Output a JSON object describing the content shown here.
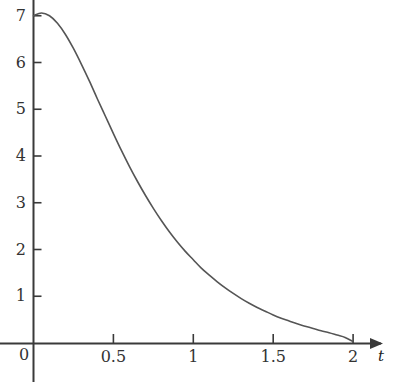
{
  "chart_data": {
    "type": "line",
    "title": "",
    "subtitle": "",
    "xlabel": "t",
    "ylabel": "",
    "xlim": [
      0,
      2.13
    ],
    "ylim": [
      -0.08,
      7.45
    ],
    "grid": false,
    "legend": null,
    "axis_style": {
      "x_axis_arrow": true,
      "y_axis_arrow": false,
      "x_tick_direction": "up",
      "y_tick_direction": "right",
      "axis_color": "#3a3a3a",
      "curve_color": "#555555",
      "curve_width": 1.6
    },
    "xticks": [
      0,
      0.5,
      1,
      1.5,
      2
    ],
    "xtick_labels": [
      "0",
      "0.5",
      "1",
      "1.5",
      "2"
    ],
    "yticks": [
      0,
      1,
      2,
      3,
      4,
      5,
      6,
      7
    ],
    "ytick_labels": [
      "0",
      "1",
      "2",
      "3",
      "4",
      "5",
      "6",
      "7"
    ],
    "ytick_labels_shown": [
      "1",
      "2",
      "3",
      "4",
      "5",
      "6",
      "7"
    ],
    "origin_label": "0",
    "series": [
      {
        "name": "curve",
        "color": "#555555",
        "x": [
          0.0,
          0.05,
          0.1,
          0.15,
          0.2,
          0.25,
          0.3,
          0.35,
          0.4,
          0.45,
          0.5,
          0.55,
          0.6,
          0.65,
          0.7,
          0.75,
          0.8,
          0.85,
          0.9,
          0.95,
          1.0,
          1.05,
          1.1,
          1.15,
          1.2,
          1.25,
          1.3,
          1.35,
          1.4,
          1.45,
          1.5,
          1.55,
          1.6,
          1.65,
          1.7,
          1.75,
          1.8,
          1.85,
          1.9,
          1.95,
          2.0
        ],
        "y": [
          7.0,
          7.06,
          7.0,
          6.84,
          6.6,
          6.3,
          5.96,
          5.6,
          5.22,
          4.85,
          4.48,
          4.12,
          3.78,
          3.46,
          3.16,
          2.88,
          2.62,
          2.38,
          2.16,
          1.96,
          1.78,
          1.6,
          1.45,
          1.31,
          1.18,
          1.06,
          0.95,
          0.85,
          0.76,
          0.68,
          0.6,
          0.53,
          0.47,
          0.41,
          0.36,
          0.31,
          0.26,
          0.22,
          0.17,
          0.12,
          0.03
        ]
      }
    ],
    "annotations": []
  },
  "axes": {
    "x_axis_name": "t",
    "y_axis_name": ""
  }
}
